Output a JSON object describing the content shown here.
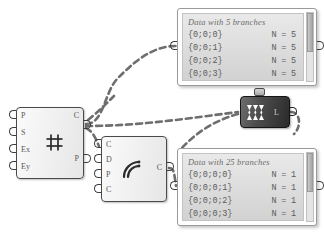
{
  "app": {
    "name": "grasshopper-canvas",
    "background": "#ffffff",
    "wire_color": "#6b6b6b"
  },
  "components": [
    {
      "id": "surface-divide",
      "icon": "grid-hash-icon",
      "inputs": [
        "P",
        "S",
        "Ex",
        "Ey"
      ],
      "outputs": [
        "C",
        "P"
      ]
    },
    {
      "id": "arc-fillet",
      "icon": "arc-curve-icon",
      "inputs": [
        "C",
        "D",
        "P",
        "C"
      ],
      "outputs": [
        "C"
      ]
    },
    {
      "id": "flatten-tree",
      "icon": "flatten-icon",
      "inputs": [],
      "outputs": [
        "L"
      ],
      "accent": "#2a2a2a"
    }
  ],
  "panels": [
    {
      "id": "panel-five-branches",
      "title": "Data with 5 branches",
      "rows": [
        {
          "path": "{0;0;0}",
          "count": "N = 5"
        },
        {
          "path": "{0;0;1}",
          "count": "N = 5"
        },
        {
          "path": "{0;0;2}",
          "count": "N = 5"
        },
        {
          "path": "{0;0;3}",
          "count": "N = 5"
        }
      ]
    },
    {
      "id": "panel-twentyfive-branches",
      "title": "Data with 25 branches",
      "rows": [
        {
          "path": "{0;0;0;0}",
          "count": "N = 1"
        },
        {
          "path": "{0;0;0;1}",
          "count": "N = 1"
        },
        {
          "path": "{0;0;0;2}",
          "count": "N = 1"
        },
        {
          "path": "{0;0;0;3}",
          "count": "N = 1"
        }
      ]
    }
  ]
}
